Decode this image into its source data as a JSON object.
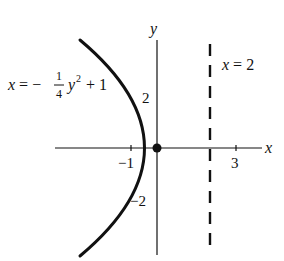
{
  "diagram": {
    "type": "function-graph",
    "axes": {
      "x_label": "x",
      "y_label": "y",
      "x_ticks": [
        {
          "value": -1,
          "label": "−1"
        },
        {
          "value": 3,
          "label": "3"
        }
      ],
      "y_ticks": [
        {
          "value": 2,
          "label": "2"
        },
        {
          "value": -2,
          "label": "−2"
        }
      ]
    },
    "curve": {
      "equation_label_lhs": "x = −",
      "equation_frac_num": "1",
      "equation_frac_den": "4",
      "equation_var": "y",
      "equation_exp": "2",
      "equation_tail": " + 1",
      "equation_text": "x = -1/4 y^2 + 1",
      "vertex": [
        1,
        0
      ],
      "y_intercepts": [
        2,
        -2
      ]
    },
    "asymptote_line": {
      "label": "x = 2",
      "x": 2,
      "style": "dashed"
    },
    "point": {
      "coords": [
        0,
        0
      ],
      "style": "filled-dot"
    },
    "colors": {
      "ink": "#111111",
      "background": "#ffffff"
    }
  }
}
